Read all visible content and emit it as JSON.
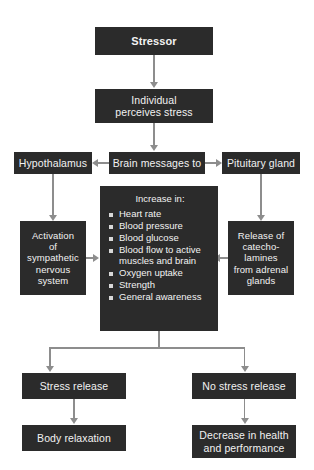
{
  "diagram": {
    "colors": {
      "node_fill": "#2b2b2b",
      "node_text": "#f2f2f2",
      "connector": "#8d8d8d",
      "background": "#ffffff"
    },
    "nodes": {
      "stressor": "Stressor",
      "individual_perceives": {
        "line1": "Individual",
        "line2": "perceives stress"
      },
      "hypothalamus": "Hypothalamus",
      "brain_messages": "Brain messages to",
      "pituitary_gland": "Pituitary gland",
      "sympathetic": {
        "line1": "Activation",
        "line2": "of",
        "line3": "sympathetic",
        "line4": "nervous",
        "line5": "system"
      },
      "catecholamines": {
        "line1": "Release of",
        "line2": "catecho-",
        "line3": "lamines",
        "line4": "from adrenal",
        "line5": "glands"
      },
      "increase": {
        "heading": "Increase in:",
        "items": [
          "Heart rate",
          "Blood pressure",
          "Blood glucose",
          "Blood flow to active muscles and brain",
          "Oxygen uptake",
          "Strength",
          "General awareness"
        ]
      },
      "stress_release": "Stress release",
      "no_stress_release": "No stress release",
      "body_relaxation": "Body relaxation",
      "decrease": {
        "line1": "Decrease in health",
        "line2": "and performance"
      }
    }
  }
}
